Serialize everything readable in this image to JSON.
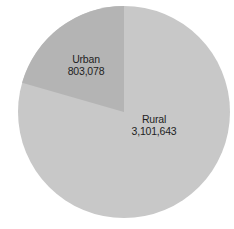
{
  "chart_data": {
    "type": "pie",
    "title": "",
    "categories": [
      "Urban",
      "Rural"
    ],
    "values": [
      803078,
      3101643
    ],
    "value_labels": [
      "803,078",
      "3,101,643"
    ],
    "colors": [
      "#b4b4b4",
      "#c8c8c8"
    ],
    "start_angle_deg": 0,
    "direction": "counterclockwise-first-slice",
    "legend": "none",
    "labels_inside": true
  },
  "labels": {
    "urban": {
      "name": "Urban",
      "value": "803,078"
    },
    "rural": {
      "name": "Rural",
      "value": "3,101,643"
    }
  }
}
